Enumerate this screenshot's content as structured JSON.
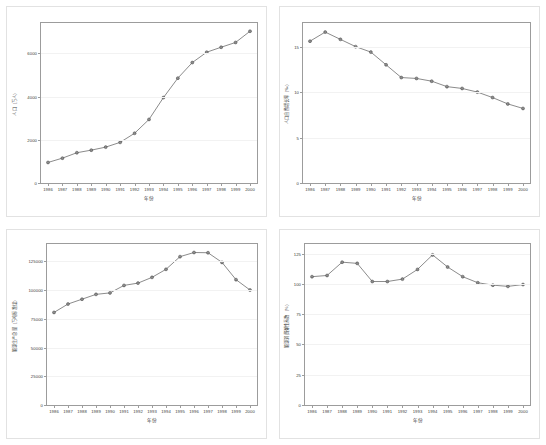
{
  "figure": {
    "background": "#ffffff",
    "line_color": "#595959",
    "marker_color": "#8c8c8c",
    "axis_color": "#9c9c9c",
    "panel_count": 4
  },
  "chart_data": [
    {
      "id": "panel-1",
      "type": "line",
      "title": "",
      "xlabel": "年份",
      "ylabel": "人口（万人）",
      "x": [
        1986,
        1987,
        1988,
        1989,
        1990,
        1991,
        1992,
        1993,
        1994,
        1995,
        1996,
        1997,
        1998,
        1999,
        2000
      ],
      "categories": [
        "1986",
        "1987",
        "1988",
        "1989",
        "1990",
        "1991",
        "1992",
        "1993",
        "1994",
        "1995",
        "1996",
        "1997",
        "1998",
        "1999",
        "2000"
      ],
      "values": [
        950,
        1150,
        1400,
        1520,
        1660,
        1880,
        2300,
        2940,
        3950,
        4850,
        5570,
        6050,
        6280,
        6500,
        7020
      ],
      "ylim": [
        0,
        7400
      ],
      "yticks": [
        0,
        2000,
        4000,
        6000
      ],
      "ytick_labels": [
        "0",
        "2000",
        "4000",
        "6000"
      ],
      "grid": true,
      "legend": null,
      "markers": "circle"
    },
    {
      "id": "panel-2",
      "type": "line",
      "title": "",
      "xlabel": "年份",
      "ylabel": "人口自然增长率（‰）",
      "x": [
        1986,
        1987,
        1988,
        1989,
        1990,
        1991,
        1992,
        1993,
        1994,
        1995,
        1996,
        1997,
        1998,
        1999,
        2000
      ],
      "categories": [
        "1986",
        "1987",
        "1988",
        "1989",
        "1990",
        "1991",
        "1992",
        "1993",
        "1994",
        "1995",
        "1996",
        "1997",
        "1998",
        "1999",
        "2000"
      ],
      "values": [
        15.6,
        16.6,
        15.8,
        15.0,
        14.4,
        13.0,
        11.6,
        11.5,
        11.2,
        10.6,
        10.4,
        10.0,
        9.4,
        8.7,
        8.2
      ],
      "ylim": [
        0,
        17.6
      ],
      "yticks": [
        0,
        5,
        10,
        15
      ],
      "ytick_labels": [
        "0",
        "5",
        "10",
        "15"
      ],
      "grid": true,
      "legend": null,
      "markers": "circle"
    },
    {
      "id": "panel-3",
      "type": "line",
      "title": "",
      "xlabel": "年份",
      "ylabel": "能源生产总量（万吨标准煤）",
      "x": [
        1986,
        1987,
        1988,
        1989,
        1990,
        1991,
        1992,
        1993,
        1994,
        1995,
        1996,
        1997,
        1998,
        1999,
        2000
      ],
      "categories": [
        "1986",
        "1987",
        "1988",
        "1989",
        "1990",
        "1991",
        "1992",
        "1993",
        "1994",
        "1995",
        "1996",
        "1997",
        "1998",
        "1999",
        "2000"
      ],
      "values": [
        80500,
        87800,
        92000,
        96200,
        97500,
        104000,
        106000,
        111000,
        118000,
        129000,
        132600,
        132400,
        124000,
        109000,
        100000
      ],
      "ylim": [
        0,
        140000
      ],
      "yticks": [
        0,
        25000,
        50000,
        75000,
        100000,
        125000
      ],
      "ytick_labels": [
        "0",
        "25000",
        "50000",
        "75000",
        "100000",
        "125000"
      ],
      "grid": true,
      "legend": null,
      "markers": "circle"
    },
    {
      "id": "panel-4",
      "type": "line",
      "title": "",
      "xlabel": "年份",
      "ylabel": "能源消费弹性系数（%）",
      "x": [
        1986,
        1987,
        1988,
        1989,
        1990,
        1991,
        1992,
        1993,
        1994,
        1995,
        1996,
        1997,
        1998,
        1999,
        2000
      ],
      "categories": [
        "1986",
        "1987",
        "1988",
        "1989",
        "1990",
        "1991",
        "1992",
        "1993",
        "1994",
        "1995",
        "1996",
        "1997",
        "1998",
        "1999",
        "2000"
      ],
      "values": [
        106,
        107,
        118,
        117,
        102,
        102,
        104,
        112,
        124,
        114,
        106,
        101,
        99,
        98,
        99.5
      ],
      "ylim": [
        0,
        133
      ],
      "yticks": [
        0,
        25,
        50,
        75,
        100,
        125
      ],
      "ytick_labels": [
        "0",
        "25",
        "50",
        "75",
        "100",
        "125"
      ],
      "grid": true,
      "legend": null,
      "markers": "circle"
    }
  ]
}
